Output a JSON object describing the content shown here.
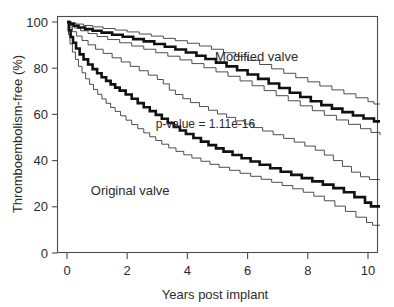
{
  "chart_data": {
    "type": "line",
    "subtype": "kaplan-meier-step",
    "title": "",
    "xlabel": "Years post implant",
    "ylabel": "Thromboembolism-free (%)",
    "xlim": [
      0,
      10.4
    ],
    "ylim": [
      0,
      100
    ],
    "xticks": [
      0,
      2,
      4,
      6,
      8,
      10
    ],
    "xtick_labels": [
      "0",
      "2",
      "4",
      "6",
      "8",
      "10"
    ],
    "yticks": [
      0,
      20,
      40,
      60,
      80,
      100
    ],
    "ytick_labels": [
      "0",
      "20",
      "40",
      "60",
      "80",
      "100"
    ],
    "grid": false,
    "legend": "inline-annotations",
    "annotations": [
      {
        "name": "modified-valve-label",
        "text": "Modified valve",
        "x": 6.3,
        "y": 83
      },
      {
        "name": "original-valve-label",
        "text": "Original valve",
        "x": 2.1,
        "y": 25
      },
      {
        "name": "p-value-label",
        "text": "p-value =  1.11e-16",
        "x": 4.6,
        "y": 54
      }
    ],
    "series": [
      {
        "name": "Modified valve",
        "role": "estimate",
        "style": "bold-step",
        "points": [
          [
            0.0,
            100
          ],
          [
            0.1,
            99.2
          ],
          [
            0.22,
            98.4
          ],
          [
            0.38,
            97.6
          ],
          [
            0.6,
            96.9
          ],
          [
            0.85,
            96.2
          ],
          [
            1.15,
            95.4
          ],
          [
            1.5,
            94.5
          ],
          [
            1.85,
            93.6
          ],
          [
            2.2,
            92.6
          ],
          [
            2.55,
            91.6
          ],
          [
            2.9,
            90.5
          ],
          [
            3.25,
            89.3
          ],
          [
            3.6,
            88.1
          ],
          [
            3.95,
            86.8
          ],
          [
            4.3,
            85.4
          ],
          [
            4.6,
            84.0
          ],
          [
            4.95,
            82.4
          ],
          [
            5.3,
            80.8
          ],
          [
            5.65,
            79.1
          ],
          [
            6.0,
            77.3
          ],
          [
            6.35,
            75.4
          ],
          [
            6.7,
            73.4
          ],
          [
            7.05,
            71.4
          ],
          [
            7.4,
            69.4
          ],
          [
            7.75,
            67.5
          ],
          [
            8.1,
            65.7
          ],
          [
            8.45,
            64.0
          ],
          [
            8.8,
            62.5
          ],
          [
            9.15,
            61.0
          ],
          [
            9.5,
            59.5
          ],
          [
            9.85,
            58.2
          ],
          [
            10.2,
            57.0
          ],
          [
            10.4,
            57.0
          ]
        ],
        "value_at_10_years": 57
      },
      {
        "name": "Modified valve upper 95% CI",
        "role": "upper-ci",
        "style": "thin-step",
        "points": [
          [
            0.0,
            100
          ],
          [
            0.12,
            99.6
          ],
          [
            0.3,
            99.1
          ],
          [
            0.55,
            98.5
          ],
          [
            0.85,
            97.9
          ],
          [
            1.2,
            97.2
          ],
          [
            1.6,
            96.5
          ],
          [
            2.0,
            95.7
          ],
          [
            2.4,
            94.8
          ],
          [
            2.8,
            93.9
          ],
          [
            3.2,
            92.9
          ],
          [
            3.6,
            91.9
          ],
          [
            4.0,
            90.8
          ],
          [
            4.4,
            89.6
          ],
          [
            4.8,
            88.2
          ],
          [
            5.2,
            86.7
          ],
          [
            5.6,
            85.1
          ],
          [
            6.0,
            83.4
          ],
          [
            6.4,
            81.6
          ],
          [
            6.8,
            79.7
          ],
          [
            7.2,
            77.8
          ],
          [
            7.6,
            75.9
          ],
          [
            8.0,
            74.1
          ],
          [
            8.4,
            72.3
          ],
          [
            8.8,
            70.6
          ],
          [
            9.2,
            68.9
          ],
          [
            9.6,
            67.2
          ],
          [
            10.0,
            65.5
          ],
          [
            10.2,
            64.5
          ],
          [
            10.4,
            64.5
          ]
        ],
        "value_at_10_years": 65
      },
      {
        "name": "Modified valve lower 95% CI",
        "role": "lower-ci",
        "style": "thin-step",
        "points": [
          [
            0.0,
            100
          ],
          [
            0.1,
            98.6
          ],
          [
            0.25,
            97.4
          ],
          [
            0.45,
            96.2
          ],
          [
            0.7,
            95.0
          ],
          [
            1.0,
            93.7
          ],
          [
            1.35,
            92.4
          ],
          [
            1.75,
            91.0
          ],
          [
            2.15,
            89.6
          ],
          [
            2.55,
            88.2
          ],
          [
            2.95,
            86.7
          ],
          [
            3.35,
            85.2
          ],
          [
            3.75,
            83.6
          ],
          [
            4.15,
            82.0
          ],
          [
            4.55,
            80.2
          ],
          [
            4.95,
            78.4
          ],
          [
            5.35,
            76.5
          ],
          [
            5.75,
            74.5
          ],
          [
            6.15,
            72.4
          ],
          [
            6.55,
            70.3
          ],
          [
            6.95,
            68.1
          ],
          [
            7.35,
            65.9
          ],
          [
            7.75,
            63.7
          ],
          [
            8.15,
            61.6
          ],
          [
            8.55,
            59.6
          ],
          [
            8.95,
            57.6
          ],
          [
            9.35,
            55.7
          ],
          [
            9.75,
            53.8
          ],
          [
            10.1,
            52.2
          ],
          [
            10.4,
            51.0
          ]
        ],
        "value_at_10_years": 51
      },
      {
        "name": "Original valve",
        "role": "estimate",
        "style": "bold-step",
        "points": [
          [
            0.0,
            100
          ],
          [
            0.06,
            96.5
          ],
          [
            0.12,
            93.5
          ],
          [
            0.2,
            91.0
          ],
          [
            0.3,
            88.5
          ],
          [
            0.42,
            86.0
          ],
          [
            0.55,
            83.8
          ],
          [
            0.7,
            81.6
          ],
          [
            0.85,
            79.6
          ],
          [
            1.0,
            77.8
          ],
          [
            1.15,
            76.1
          ],
          [
            1.3,
            74.5
          ],
          [
            1.45,
            73.0
          ],
          [
            1.6,
            71.6
          ],
          [
            1.75,
            70.3
          ],
          [
            1.95,
            68.6
          ],
          [
            2.15,
            66.8
          ],
          [
            2.35,
            64.9
          ],
          [
            2.55,
            63.1
          ],
          [
            2.75,
            61.4
          ],
          [
            2.95,
            59.8
          ],
          [
            3.15,
            58.1
          ],
          [
            3.35,
            56.3
          ],
          [
            3.55,
            54.6
          ],
          [
            3.75,
            53.0
          ],
          [
            3.95,
            51.5
          ],
          [
            4.2,
            49.8
          ],
          [
            4.45,
            48.2
          ],
          [
            4.7,
            46.7
          ],
          [
            4.95,
            45.3
          ],
          [
            5.2,
            43.9
          ],
          [
            5.5,
            42.4
          ],
          [
            5.8,
            41.0
          ],
          [
            6.1,
            39.6
          ],
          [
            6.4,
            38.2
          ],
          [
            6.75,
            36.7
          ],
          [
            7.1,
            35.2
          ],
          [
            7.45,
            33.8
          ],
          [
            7.8,
            32.4
          ],
          [
            8.15,
            31.0
          ],
          [
            8.5,
            29.6
          ],
          [
            8.85,
            28.1
          ],
          [
            9.2,
            26.3
          ],
          [
            9.55,
            24.2
          ],
          [
            9.9,
            21.8
          ],
          [
            10.1,
            20.2
          ],
          [
            10.4,
            20.2
          ]
        ],
        "value_at_10_years": 20
      },
      {
        "name": "Original valve upper 95% CI",
        "role": "upper-ci",
        "style": "thin-step",
        "points": [
          [
            0.0,
            100
          ],
          [
            0.08,
            97.8
          ],
          [
            0.18,
            95.8
          ],
          [
            0.32,
            93.9
          ],
          [
            0.5,
            92.0
          ],
          [
            0.7,
            90.1
          ],
          [
            0.95,
            88.2
          ],
          [
            1.2,
            86.4
          ],
          [
            1.5,
            84.5
          ],
          [
            1.8,
            82.7
          ],
          [
            2.1,
            80.8
          ],
          [
            2.4,
            78.9
          ],
          [
            2.7,
            77.0
          ],
          [
            3.0,
            75.1
          ],
          [
            3.2,
            73.2
          ],
          [
            3.4,
            70.5
          ],
          [
            3.6,
            68.6
          ],
          [
            3.85,
            66.8
          ],
          [
            4.1,
            65.1
          ],
          [
            4.4,
            63.4
          ],
          [
            4.7,
            61.8
          ],
          [
            5.0,
            60.2
          ],
          [
            5.3,
            58.7
          ],
          [
            5.6,
            57.2
          ],
          [
            5.9,
            55.8
          ],
          [
            6.2,
            54.3
          ],
          [
            6.5,
            52.8
          ],
          [
            6.85,
            51.2
          ],
          [
            7.2,
            49.6
          ],
          [
            7.55,
            48.0
          ],
          [
            7.9,
            46.3
          ],
          [
            8.25,
            44.5
          ],
          [
            8.55,
            42.4
          ],
          [
            8.85,
            40.0
          ],
          [
            9.15,
            37.5
          ],
          [
            9.45,
            35.0
          ],
          [
            9.75,
            33.0
          ],
          [
            10.05,
            31.8
          ],
          [
            10.4,
            31.8
          ]
        ],
        "value_at_10_years": 32
      },
      {
        "name": "Original valve lower 95% CI",
        "role": "lower-ci",
        "style": "thin-step",
        "points": [
          [
            0.0,
            100
          ],
          [
            0.05,
            94.5
          ],
          [
            0.1,
            90.5
          ],
          [
            0.18,
            87.0
          ],
          [
            0.28,
            83.8
          ],
          [
            0.38,
            80.8
          ],
          [
            0.5,
            78.0
          ],
          [
            0.62,
            75.4
          ],
          [
            0.75,
            73.0
          ],
          [
            0.88,
            70.8
          ],
          [
            1.02,
            68.7
          ],
          [
            1.16,
            66.7
          ],
          [
            1.3,
            64.8
          ],
          [
            1.45,
            63.0
          ],
          [
            1.6,
            61.3
          ],
          [
            1.78,
            59.4
          ],
          [
            1.96,
            57.5
          ],
          [
            2.15,
            55.6
          ],
          [
            2.35,
            53.8
          ],
          [
            2.55,
            52.0
          ],
          [
            2.75,
            50.3
          ],
          [
            2.95,
            48.7
          ],
          [
            3.15,
            47.1
          ],
          [
            3.38,
            45.5
          ],
          [
            3.62,
            44.0
          ],
          [
            3.88,
            42.5
          ],
          [
            4.15,
            41.1
          ],
          [
            4.45,
            39.7
          ],
          [
            4.75,
            38.4
          ],
          [
            5.05,
            37.1
          ],
          [
            5.4,
            35.8
          ],
          [
            5.75,
            34.5
          ],
          [
            6.1,
            33.2
          ],
          [
            6.45,
            31.9
          ],
          [
            6.8,
            30.6
          ],
          [
            7.15,
            29.2
          ],
          [
            7.5,
            27.8
          ],
          [
            7.85,
            26.3
          ],
          [
            8.2,
            24.6
          ],
          [
            8.55,
            22.6
          ],
          [
            8.9,
            20.3
          ],
          [
            9.25,
            18.0
          ],
          [
            9.6,
            15.5
          ],
          [
            9.95,
            13.2
          ],
          [
            10.15,
            12.0
          ],
          [
            10.4,
            12.0
          ]
        ],
        "value_at_10_years": 12
      }
    ]
  }
}
